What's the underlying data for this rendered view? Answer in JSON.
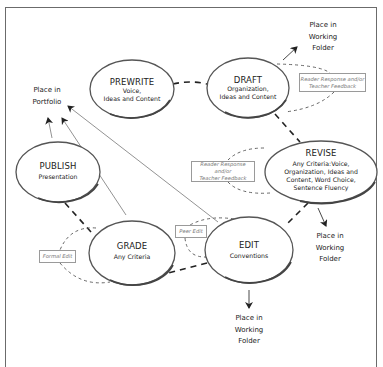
{
  "diagram": {
    "stages": [
      {
        "id": "prewrite",
        "title": "PREWRITE",
        "subtitle_lines": [
          "Voice,",
          "Ideas and Content"
        ]
      },
      {
        "id": "draft",
        "title": "DRAFT",
        "subtitle_lines": [
          "Organization,",
          "Ideas and Content"
        ]
      },
      {
        "id": "revise",
        "title": "REVISE",
        "subtitle_lines": [
          "Any Criteria:Voice,",
          "Organization, Ideas and",
          "Content, Word Choice,",
          "Sentence Fluency"
        ]
      },
      {
        "id": "edit",
        "title": "EDIT",
        "subtitle_lines": [
          "Conventions"
        ]
      },
      {
        "id": "grade",
        "title": "GRADE",
        "subtitle_lines": [
          "Any Criteria"
        ]
      },
      {
        "id": "publish",
        "title": "PUBLISH",
        "subtitle_lines": [
          "Presentation"
        ]
      }
    ],
    "destinations": {
      "portfolio": [
        "Place in",
        "Portfolio"
      ],
      "working_folder_draft": [
        "Place in",
        "Working",
        "Folder"
      ],
      "working_folder_revise": [
        "Place in",
        "Working",
        "Folder"
      ],
      "working_folder_edit": [
        "Place in",
        "Working",
        "Folder"
      ]
    },
    "feedback_boxes": {
      "draft_feedback": [
        "Reader Response and/or",
        "Teacher Feedback"
      ],
      "revise_feedback": [
        "Reader Response and/or",
        "Teacher Feedback"
      ],
      "peer_edit": [
        "Peer Edit"
      ],
      "formal_edit": [
        "Formal Edit"
      ]
    },
    "colors": {
      "stroke": "#444444",
      "ellipse_shadow": "#5a5a5a",
      "thin_line": "#7a7a7a",
      "feedback_text": "#777777"
    }
  }
}
